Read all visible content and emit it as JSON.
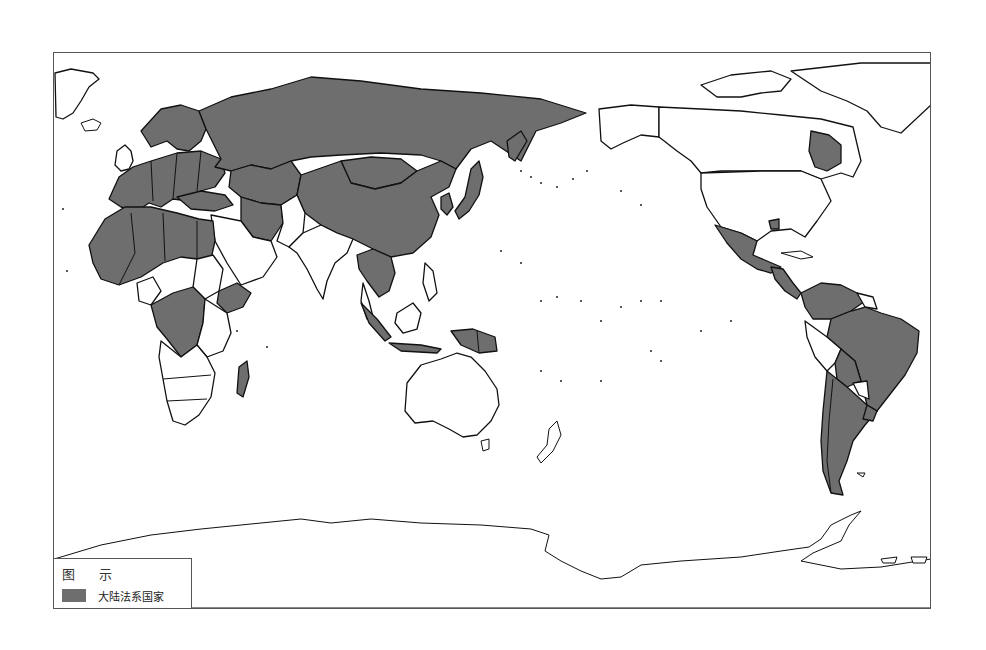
{
  "map": {
    "title": "",
    "projection": "Pacific-centered world map",
    "colors": {
      "civil_law_fill": "#6e6e6e",
      "other_fill": "#ffffff",
      "border_stroke": "#111111",
      "frame_stroke": "#555555"
    },
    "highlighted_category": "大陆法系国家",
    "highlighted_regions": [
      "Continental Europe",
      "Russia",
      "Central Asia",
      "Mongolia",
      "China",
      "Japan",
      "South Korea",
      "Turkey",
      "Iran",
      "Iraq",
      "Syria",
      "Egypt",
      "Libya",
      "Algeria",
      "Morocco",
      "Tunisia",
      "West Africa (francophone)",
      "Chad",
      "Niger",
      "Mali",
      "Central African Republic",
      "DR Congo",
      "Congo",
      "Gabon",
      "Cameroon",
      "Ethiopia",
      "Madagascar",
      "Indochina (Thailand, Laos, Vietnam, Cambodia)",
      "Indonesia",
      "Quebec",
      "Louisiana",
      "Mexico",
      "Central America",
      "Cuba",
      "Colombia",
      "Venezuela",
      "Ecuador",
      "Brazil",
      "Bolivia",
      "Uruguay",
      "Argentina",
      "Chile"
    ]
  },
  "legend": {
    "title": "图 示",
    "items": [
      {
        "label": "大陆法系国家",
        "color": "#6e6e6e"
      }
    ]
  }
}
